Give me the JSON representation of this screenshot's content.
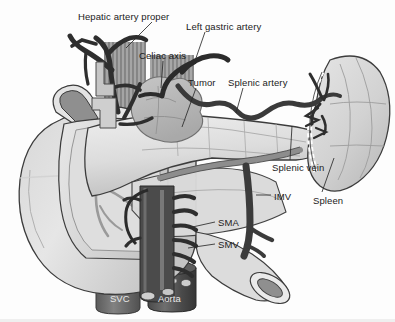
{
  "figure": {
    "type": "medical-illustration",
    "style": "grayscale line drawing",
    "width": 395,
    "height": 322,
    "background_color": "#fdfdfd"
  },
  "palette": {
    "text": "#1b1b1b",
    "text_on_vessel": "#e9e9e9",
    "leader_line": "#2a2a2a",
    "organ_light": "#e3e3e3",
    "organ_mid": "#c9c9c9",
    "organ_shade": "#b4b4b4",
    "outline": "#3a3a3a",
    "vessel_dark": "#3b3b3b",
    "vessel_darker": "#2b2b2b",
    "vessel_mid": "#6e6e6e",
    "tumor_fill": "#b9b9b9",
    "hatch": "#8a8a8a"
  },
  "labels": [
    {
      "id": "hepatic-artery-proper",
      "text": "Hepatic artery proper",
      "x": 78,
      "y": 12,
      "anchor": "start",
      "leader": {
        "x1": 152,
        "y1": 22,
        "x2": 126,
        "y2": 48
      }
    },
    {
      "id": "left-gastric-artery",
      "text": "Left gastric artery",
      "x": 186,
      "y": 22,
      "anchor": "start",
      "leader": {
        "x1": 205,
        "y1": 32,
        "x2": 196,
        "y2": 58
      }
    },
    {
      "id": "celiac-axis",
      "text": "Celiac axis",
      "x": 139,
      "y": 51,
      "anchor": "start",
      "leader": {
        "x1": 163,
        "y1": 61,
        "x2": 161,
        "y2": 88
      }
    },
    {
      "id": "tumor",
      "text": "Tumor",
      "x": 188,
      "y": 78,
      "anchor": "start",
      "leader": {
        "x1": 196,
        "y1": 88,
        "x2": 182,
        "y2": 127
      }
    },
    {
      "id": "splenic-artery",
      "text": "Splenic artery",
      "x": 228,
      "y": 78,
      "anchor": "start",
      "leader": {
        "x1": 243,
        "y1": 88,
        "x2": 236,
        "y2": 113
      }
    },
    {
      "id": "splenic-vein",
      "text": "Splenic vein",
      "x": 272,
      "y": 163,
      "anchor": "start",
      "leader": {
        "x1": 290,
        "y1": 160,
        "x2": 292,
        "y2": 126
      }
    },
    {
      "id": "imv",
      "text": "IMV",
      "x": 274,
      "y": 192,
      "anchor": "start",
      "leader": {
        "x1": 271,
        "y1": 195,
        "x2": 256,
        "y2": 195
      }
    },
    {
      "id": "spleen",
      "text": "Spleen",
      "x": 313,
      "y": 196,
      "anchor": "start",
      "leader": {
        "x1": 322,
        "y1": 192,
        "x2": 334,
        "y2": 158
      }
    },
    {
      "id": "sma",
      "text": "SMA",
      "x": 218,
      "y": 218,
      "anchor": "start",
      "leader": {
        "x1": 215,
        "y1": 222,
        "x2": 188,
        "y2": 228
      }
    },
    {
      "id": "smv",
      "text": "SMV",
      "x": 218,
      "y": 240,
      "anchor": "start",
      "leader": {
        "x1": 215,
        "y1": 244,
        "x2": 188,
        "y2": 248
      }
    }
  ],
  "vessel_labels": [
    {
      "id": "svc",
      "text": "SVC",
      "x": 110,
      "y": 294
    },
    {
      "id": "aorta",
      "text": "Aorta",
      "x": 158,
      "y": 294
    }
  ],
  "structures": [
    {
      "id": "liver",
      "name": "Liver"
    },
    {
      "id": "duodenum",
      "name": "Duodenum"
    },
    {
      "id": "pancreas-head",
      "name": "Pancreas head"
    },
    {
      "id": "pancreas-body-tail",
      "name": "Pancreas body and tail"
    },
    {
      "id": "spleen-organ",
      "name": "Spleen"
    },
    {
      "id": "tumor-mass",
      "name": "Tumor mass"
    },
    {
      "id": "jejunum-loop",
      "name": "Jejunal loop"
    },
    {
      "id": "aorta-vessel",
      "name": "Aorta"
    },
    {
      "id": "svc-vessel",
      "name": "Superior vena cava"
    },
    {
      "id": "celiac-trunk",
      "name": "Celiac axis"
    },
    {
      "id": "splenic-artery-vessel",
      "name": "Splenic artery"
    },
    {
      "id": "splenic-vein-vessel",
      "name": "Splenic vein"
    },
    {
      "id": "left-gastric-vessel",
      "name": "Left gastric artery"
    },
    {
      "id": "hepatic-artery-vessel",
      "name": "Hepatic artery proper"
    },
    {
      "id": "sma-vessel",
      "name": "Superior mesenteric artery"
    },
    {
      "id": "smv-vessel",
      "name": "Superior mesenteric vein"
    },
    {
      "id": "imv-vessel",
      "name": "Inferior mesenteric vein"
    }
  ]
}
